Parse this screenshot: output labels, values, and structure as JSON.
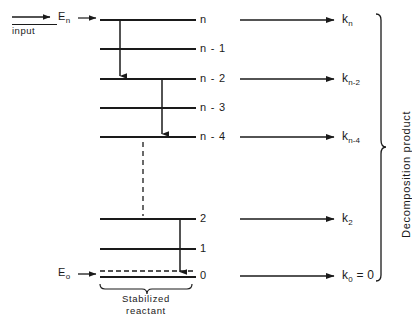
{
  "figure": {
    "background_color": "#ffffff",
    "stroke_color": "#1a1a1a",
    "width": 412,
    "height": 318
  },
  "input": {
    "arrow_label": "input",
    "energy_label_base": "E",
    "energy_label_sub": "n",
    "entry_arrow_name": "input-arrow"
  },
  "ground": {
    "energy_label_base": "E",
    "energy_label_sub": "o"
  },
  "levels": [
    {
      "id": "n",
      "label_base": "n",
      "label_suffix": "",
      "y": 20,
      "x1": 100,
      "x2": 196,
      "style": "solid"
    },
    {
      "id": "n-1",
      "label_base": "n",
      "label_suffix": " - 1",
      "y": 49,
      "x1": 100,
      "x2": 196,
      "style": "solid"
    },
    {
      "id": "n-2",
      "label_base": "n",
      "label_suffix": " - 2",
      "y": 79,
      "x1": 100,
      "x2": 196,
      "style": "solid"
    },
    {
      "id": "n-3",
      "label_base": "n",
      "label_suffix": " - 3",
      "y": 108,
      "x1": 100,
      "x2": 196,
      "style": "solid"
    },
    {
      "id": "n-4",
      "label_base": "n",
      "label_suffix": " - 4",
      "y": 137,
      "x1": 100,
      "x2": 196,
      "style": "solid"
    },
    {
      "id": "2",
      "label_base": "2",
      "label_suffix": "",
      "y": 219,
      "x1": 100,
      "x2": 196,
      "style": "solid"
    },
    {
      "id": "1",
      "label_base": "1",
      "label_suffix": "",
      "y": 249,
      "x1": 100,
      "x2": 196,
      "style": "solid"
    },
    {
      "id": "0",
      "label_base": "0",
      "label_suffix": "",
      "y": 276,
      "x1": 100,
      "x2": 196,
      "style": "solid-with-dashed"
    }
  ],
  "cascade_arrows": [
    {
      "name": "cascade-n-to-n-2",
      "x": 120,
      "y1": 20,
      "y2": 79
    },
    {
      "name": "cascade-n-2-to-n-4",
      "x": 162,
      "y1": 79,
      "y2": 137
    },
    {
      "name": "cascade-2-to-0",
      "x": 180,
      "y1": 219,
      "y2": 274
    }
  ],
  "dashed_connector": {
    "name": "level-gap-dashed-line",
    "x": 143,
    "y1": 142,
    "y2": 216
  },
  "rate_arrows": [
    {
      "name": "rate-arrow-kn",
      "level": "n",
      "y": 20,
      "x1": 240,
      "x2": 338,
      "k_base": "k",
      "k_sub": "n",
      "k_eq": ""
    },
    {
      "name": "rate-arrow-kn-2",
      "level": "n-2",
      "y": 79,
      "x1": 240,
      "x2": 338,
      "k_base": "k",
      "k_sub": "n-2",
      "k_eq": ""
    },
    {
      "name": "rate-arrow-kn-4",
      "level": "n-4",
      "y": 137,
      "x1": 240,
      "x2": 338,
      "k_base": "k",
      "k_sub": "n-4",
      "k_eq": ""
    },
    {
      "name": "rate-arrow-k2",
      "level": "2",
      "y": 219,
      "x1": 240,
      "x2": 338,
      "k_base": "k",
      "k_sub": "2",
      "k_eq": ""
    },
    {
      "name": "rate-arrow-k0",
      "level": "0",
      "y": 276,
      "x1": 240,
      "x2": 338,
      "k_base": "k",
      "k_sub": "0",
      "k_eq": " = 0"
    }
  ],
  "right_brace": {
    "label": "Decomposition  product",
    "x": 381,
    "y_top": 14,
    "y_bottom": 281
  },
  "bottom_brace": {
    "label_line1": "Stabilized",
    "label_line2": "reactant",
    "x_left": 100,
    "x_right": 192,
    "y": 286
  }
}
